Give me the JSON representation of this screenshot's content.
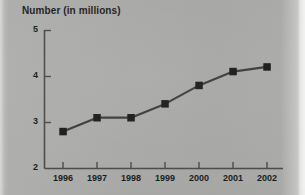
{
  "chart_data": {
    "type": "line",
    "title": "Number (in millions)",
    "xlabel": "",
    "ylabel": "",
    "categories": [
      "1996",
      "1997",
      "1998",
      "1999",
      "2000",
      "2001",
      "2002"
    ],
    "values": [
      2.8,
      3.1,
      3.1,
      3.4,
      3.8,
      4.1,
      4.2
    ],
    "series": [
      {
        "name": "Number (in millions)",
        "values": [
          2.8,
          3.1,
          3.1,
          3.4,
          3.8,
          4.1,
          4.2
        ]
      }
    ],
    "ylim": [
      2,
      5
    ],
    "yticks": [
      "2",
      "3",
      "4",
      "5"
    ],
    "ytick_values": [
      2,
      3,
      4,
      5
    ],
    "xticks": [
      "1996",
      "1997",
      "1998",
      "1999",
      "2000",
      "2001",
      "2002"
    ],
    "grid": false,
    "legend": false,
    "legend_position": "none",
    "marker": "square",
    "line_color": "#3b3b3b",
    "marker_color": "#1a1a1a",
    "axis_color": "#4a4a4a",
    "background_color": "#a8a8a6",
    "text_color": "#1b1b1b"
  }
}
